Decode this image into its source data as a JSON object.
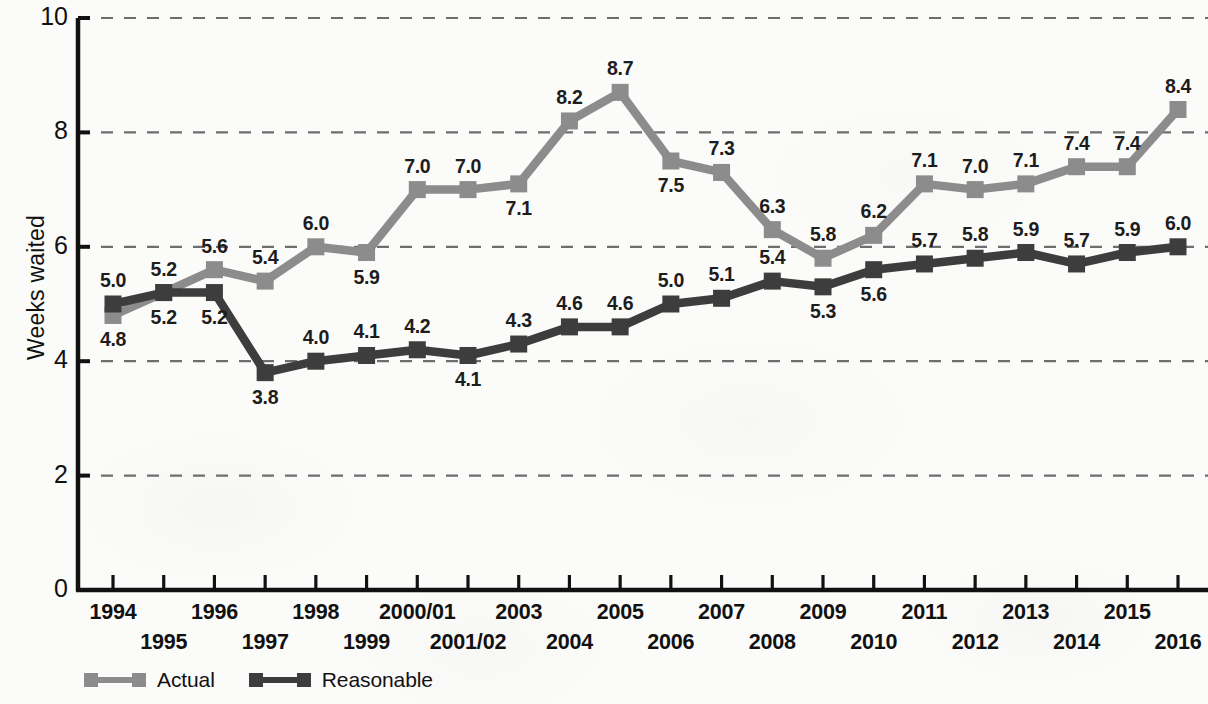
{
  "chart_data": {
    "type": "line",
    "title": "",
    "xlabel": "",
    "ylabel": "Weeks waited",
    "ylim": [
      0,
      10
    ],
    "yticks": [
      0,
      2,
      4,
      6,
      8,
      10
    ],
    "grid": "horizontal-dashed",
    "legend_position": "bottom-left",
    "categories": [
      "1994",
      "1995",
      "1996",
      "1997",
      "1998",
      "1999",
      "2000/01",
      "2001/02",
      "2003",
      "2004",
      "2005",
      "2006",
      "2007",
      "2008",
      "2009",
      "2010",
      "2011",
      "2012",
      "2013",
      "2014",
      "2015",
      "2016"
    ],
    "series": [
      {
        "name": "Actual",
        "color": "#8c8c8c",
        "values": [
          4.8,
          5.2,
          5.6,
          5.4,
          6.0,
          5.9,
          7.0,
          7.0,
          7.1,
          8.2,
          8.7,
          7.5,
          7.3,
          6.3,
          5.8,
          6.2,
          7.1,
          7.0,
          7.1,
          7.4,
          7.4,
          8.4
        ],
        "labels": [
          "4.8",
          "5.2",
          "5.6",
          "5.4",
          "6.0",
          "5.9",
          "7.0",
          "7.0",
          "7.1",
          "8.2",
          "8.7",
          "7.5",
          "7.3",
          "6.3",
          "5.8",
          "6.2",
          "7.1",
          "7.0",
          "7.1",
          "7.4",
          "7.4",
          "8.4"
        ],
        "label_positions": [
          "below",
          "above",
          "above",
          "above",
          "above",
          "below",
          "above",
          "above",
          "below",
          "above",
          "above",
          "below",
          "above",
          "above",
          "above",
          "above",
          "above",
          "above",
          "above",
          "above",
          "above",
          "above"
        ]
      },
      {
        "name": "Reasonable",
        "color": "#3d3d3d",
        "values": [
          5.0,
          5.2,
          5.2,
          3.8,
          4.0,
          4.1,
          4.2,
          4.1,
          4.3,
          4.6,
          4.6,
          5.0,
          5.1,
          5.4,
          5.3,
          5.6,
          5.7,
          5.8,
          5.9,
          5.7,
          5.9,
          6.0
        ],
        "labels": [
          "5.0",
          "5.2",
          "5.2",
          "3.8",
          "4.0",
          "4.1",
          "4.2",
          "4.1",
          "4.3",
          "4.6",
          "4.6",
          "5.0",
          "5.1",
          "5.4",
          "5.3",
          "5.6",
          "5.7",
          "5.8",
          "5.9",
          "5.7",
          "5.9",
          "6.0"
        ],
        "label_positions": [
          "above",
          "below",
          "below",
          "below",
          "above",
          "above",
          "above",
          "below",
          "above",
          "above",
          "above",
          "above",
          "above",
          "above",
          "below",
          "below",
          "above",
          "above",
          "above",
          "above",
          "above",
          "above"
        ]
      }
    ]
  },
  "axes": {
    "ylabel": "Weeks waited",
    "ytick_labels": [
      "10",
      "8",
      "6",
      "4",
      "2",
      "0"
    ],
    "ytick_values": [
      10,
      8,
      6,
      4,
      2,
      0
    ],
    "xtick_top": [
      "1994",
      "1996",
      "1998",
      "2000/01",
      "2003",
      "2005",
      "2007",
      "2009",
      "2011",
      "2013",
      "2015"
    ],
    "xtick_bottom": [
      "1995",
      "1997",
      "1999",
      "2001/02",
      "2004",
      "2006",
      "2008",
      "2010",
      "2012",
      "2014",
      "2016"
    ]
  },
  "legend": {
    "items": [
      {
        "label": "Actual",
        "color": "#8c8c8c"
      },
      {
        "label": "Reasonable",
        "color": "#3d3d3d"
      }
    ]
  }
}
